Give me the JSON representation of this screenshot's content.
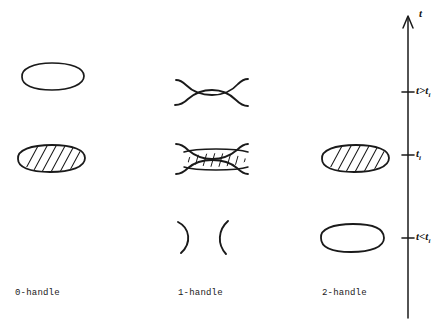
{
  "figure": {
    "title": "",
    "background_color": "#ffffff",
    "ink_color": "#1a1a1a",
    "width": 448,
    "height": 329
  },
  "columns": [
    {
      "id": "0-handle",
      "label": "0-handle",
      "label_x": 15,
      "label_y": 288
    },
    {
      "id": "1-handle",
      "label": "1-handle",
      "label_x": 178,
      "label_y": 288
    },
    {
      "id": "2-handle",
      "label": "2-handle",
      "label_x": 322,
      "label_y": 288
    }
  ],
  "axis": {
    "name": "t",
    "name_x": 418,
    "name_y": 8,
    "line_x": 408,
    "line_top": 18,
    "line_bottom": 318,
    "ticks": [
      {
        "label_html": "t&gt;t<sub>i</sub>",
        "label_text": "t>t_i",
        "y": 92,
        "label_x": 416
      },
      {
        "label_html": "t<sub>i</sub>",
        "label_text": "t_i",
        "y": 155,
        "label_x": 416
      },
      {
        "label_html": "t&lt;t<sub>i</sub>",
        "label_text": "t<t_i",
        "y": 238,
        "label_x": 416
      }
    ]
  },
  "rows": [
    {
      "id": "above",
      "time": "t>t_i",
      "y": 92
    },
    {
      "id": "at",
      "time": "t_i",
      "y": 155
    },
    {
      "id": "below",
      "time": "t<t_i",
      "y": 238
    }
  ],
  "shapes": [
    {
      "name": "zero-handle-ellipse-above",
      "column": "0-handle",
      "row": "above",
      "kind": "ellipse-outline",
      "cx": 53,
      "cy": 76,
      "rx": 32,
      "ry": 13
    },
    {
      "name": "zero-handle-ellipse-hatched-at",
      "column": "0-handle",
      "row": "at",
      "kind": "ellipse-hatched",
      "cx": 51,
      "cy": 158,
      "rx": 34,
      "ry": 14
    },
    {
      "name": "one-handle-neck-open-above",
      "column": "1-handle",
      "row": "above",
      "kind": "neck-open"
    },
    {
      "name": "one-handle-saddle-hatched-at",
      "column": "1-handle",
      "row": "at",
      "kind": "saddle-hatched"
    },
    {
      "name": "one-handle-arcs-split-below",
      "column": "1-handle",
      "row": "below",
      "kind": "arcs-split"
    },
    {
      "name": "two-handle-ellipse-hatched-at",
      "column": "2-handle",
      "row": "at",
      "kind": "ellipse-hatched",
      "cx": 355,
      "cy": 158,
      "rx": 34,
      "ry": 14
    },
    {
      "name": "two-handle-ellipse-below",
      "column": "2-handle",
      "row": "below",
      "kind": "ellipse-outline",
      "cx": 352,
      "cy": 238,
      "rx": 31,
      "ry": 14
    }
  ]
}
